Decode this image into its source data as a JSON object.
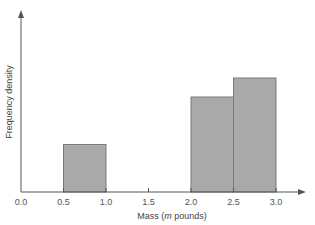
{
  "chart_data": {
    "type": "bar",
    "subtype": "histogram",
    "title": "",
    "xlabel": "Mass (m pounds)",
    "xlabel_parts": {
      "prefix": "Mass (",
      "italic": "m",
      "suffix": " pounds)"
    },
    "ylabel": "Frequency density",
    "x_ticks": [
      "0.0",
      "0.5",
      "1.0",
      "1.5",
      "2.0",
      "2.5",
      "3.0"
    ],
    "xlim": [
      0.0,
      3.3
    ],
    "y_ticks": [],
    "grid": false,
    "legend": null,
    "bins": [
      {
        "x0": 0.5,
        "x1": 1.0,
        "height": 1.0
      },
      {
        "x0": 2.0,
        "x1": 2.5,
        "height": 2.0
      },
      {
        "x0": 2.5,
        "x1": 3.0,
        "height": 2.4
      }
    ],
    "ylim": [
      0,
      3.6
    ],
    "colors": {
      "bar_fill": "#a9a9a9",
      "bar_stroke": "#7a7a7a",
      "axis": "#555555"
    }
  }
}
